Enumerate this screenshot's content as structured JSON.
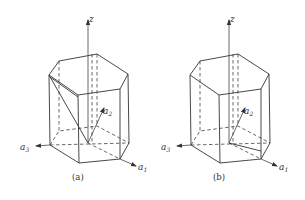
{
  "figure": {
    "panels": [
      {
        "id": "a",
        "caption": "(a)",
        "axes": {
          "z": "z",
          "a1": {
            "base": "a",
            "sub": "1"
          },
          "a2": {
            "base": "a",
            "sub": "2"
          },
          "a3": {
            "base": "a",
            "sub": "3"
          }
        },
        "extra_line": "diagonal from top-left vertex to origin"
      },
      {
        "id": "b",
        "caption": "(b)",
        "axes": {
          "z": "z",
          "a1": {
            "base": "a",
            "sub": "1"
          },
          "a2": {
            "base": "a",
            "sub": "2"
          },
          "a3": {
            "base": "a",
            "sub": "3"
          }
        },
        "extra_line": "line from origin to right bottom vertex"
      }
    ],
    "colors": {
      "line": "#333333",
      "background": "#ffffff"
    }
  }
}
